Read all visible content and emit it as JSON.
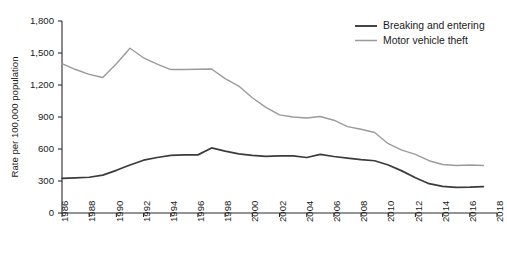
{
  "chart_data": {
    "type": "line",
    "title": "",
    "xlabel": "",
    "ylabel": "Rate per 100,000 population",
    "xlim": [
      1986,
      2018
    ],
    "ylim": [
      0,
      1800
    ],
    "grid": false,
    "legend_position": "top-right",
    "x_ticks": [
      "1986",
      "1988",
      "1990",
      "1992",
      "1994",
      "1996",
      "1998",
      "2000",
      "2002",
      "2004",
      "2006",
      "2008",
      "2010",
      "2012",
      "2014",
      "2016",
      "2018"
    ],
    "y_ticks": [
      "0",
      "300",
      "600",
      "900",
      "1,200",
      "1,500",
      "1,800"
    ],
    "x": [
      1986,
      1987,
      1988,
      1989,
      1990,
      1991,
      1992,
      1993,
      1994,
      1995,
      1996,
      1997,
      1998,
      1999,
      2000,
      2001,
      2002,
      2003,
      2004,
      2005,
      2006,
      2007,
      2008,
      2009,
      2010,
      2011,
      2012,
      2013,
      2014,
      2015,
      2016,
      2017
    ],
    "series": [
      {
        "name": "Breaking and entering",
        "color": "#3b3b3b",
        "values": [
          325,
          330,
          335,
          355,
          400,
          450,
          495,
          520,
          540,
          545,
          545,
          610,
          580,
          555,
          540,
          530,
          535,
          535,
          520,
          550,
          530,
          515,
          500,
          490,
          450,
          395,
          330,
          275,
          250,
          240,
          242,
          248
        ]
      },
      {
        "name": "Motor vehicle theft",
        "color": "#9b9b9b",
        "values": [
          1400,
          1345,
          1300,
          1270,
          1400,
          1545,
          1455,
          1395,
          1345,
          1345,
          1348,
          1350,
          1260,
          1190,
          1080,
          990,
          920,
          900,
          890,
          905,
          870,
          810,
          785,
          755,
          650,
          590,
          550,
          490,
          455,
          445,
          450,
          445
        ]
      }
    ]
  },
  "legend": {
    "items": [
      {
        "label": "Breaking and entering",
        "color": "#3b3b3b"
      },
      {
        "label": "Motor vehicle theft",
        "color": "#9b9b9b"
      }
    ]
  }
}
